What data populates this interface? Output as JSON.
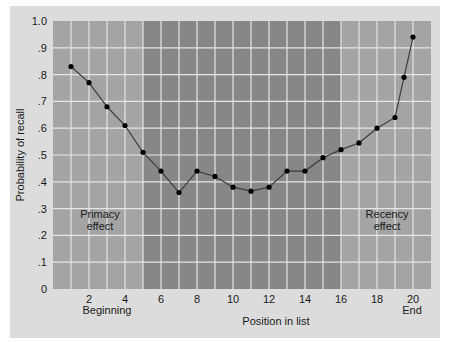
{
  "chart_data": {
    "type": "line",
    "title": "",
    "xlabel": "Position in list",
    "ylabel": "Probability of recall",
    "x_tick_labels": [
      "2",
      "4",
      "6",
      "8",
      "10",
      "12",
      "14",
      "16",
      "18",
      "20"
    ],
    "x_sublabels": {
      "2-4": "Beginning",
      "20": "End"
    },
    "y_tick_labels": [
      "0",
      ".1",
      ".2",
      ".3",
      ".4",
      ".5",
      ".6",
      ".7",
      ".8",
      ".9",
      "1.0"
    ],
    "ylim": [
      0,
      1.0
    ],
    "xlim": [
      0,
      21
    ],
    "grid": true,
    "annotations": [
      {
        "text": "Primacy effect",
        "region": "left"
      },
      {
        "text": "Recency effect",
        "region": "right"
      }
    ],
    "shaded_regions": [
      {
        "from": 0,
        "to": 5,
        "shade": "light"
      },
      {
        "from": 5,
        "to": 16,
        "shade": "dark"
      },
      {
        "from": 16,
        "to": 21,
        "shade": "light"
      }
    ],
    "series": [
      {
        "name": "Probability of recall",
        "x": [
          1,
          2,
          3,
          4,
          5,
          6,
          7,
          8,
          9,
          10,
          11,
          12,
          13,
          14,
          15,
          16,
          17,
          18,
          19,
          19.5,
          20
        ],
        "values": [
          0.83,
          0.77,
          0.68,
          0.61,
          0.51,
          0.44,
          0.36,
          0.44,
          0.42,
          0.38,
          0.365,
          0.38,
          0.44,
          0.44,
          0.49,
          0.52,
          0.545,
          0.6,
          0.64,
          0.79,
          0.94
        ]
      }
    ]
  },
  "labels": {
    "ylabel": "Probability of recall",
    "xlabel": "Position in list",
    "beginning": "Beginning",
    "end": "End",
    "primacy_1": "Primacy",
    "primacy_2": "effect",
    "recency_1": "Recency",
    "recency_2": "effect"
  },
  "colors": {
    "frame": "#dcdcdc",
    "light_band": "#a4a4a4",
    "dark_band": "#878787",
    "grid": "#e6e6e6",
    "line": "#3c3c3c",
    "marker": "#000000"
  }
}
